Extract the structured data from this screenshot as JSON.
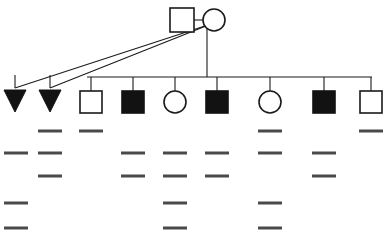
{
  "figure": {
    "type": "pedigree-with-gel",
    "background_color": "#ffffff",
    "line_color": "#1a1a1a",
    "filled_color": "#121212",
    "band_color": "#4a4a4a"
  },
  "chart_data": {
    "type": "table",
    "xlabel": "",
    "ylabel": "",
    "grid": false,
    "legend_position": "none",
    "generations": [
      {
        "id": "I",
        "label": "I",
        "y": 20,
        "members": [
          {
            "id": "I-1",
            "symbol": "square",
            "sex": "male",
            "affected": false,
            "x": 182,
            "y": 20,
            "size": 24
          },
          {
            "id": "I-2",
            "symbol": "circle",
            "sex": "female",
            "affected": false,
            "x": 214,
            "y": 20,
            "size": 22
          }
        ],
        "mating_line": {
          "x1": 194,
          "x2": 203,
          "y": 20
        }
      },
      {
        "id": "II",
        "label": "II",
        "y": 102,
        "sibship_line": {
          "x1": 87,
          "x2": 372,
          "y": 77
        },
        "descent_line": {
          "x": 207,
          "y1": 26,
          "y2": 77
        },
        "members": [
          {
            "id": "II-1",
            "symbol": "triangle",
            "sex": "unknown",
            "affected": true,
            "meaning": "pregnancy-loss",
            "x": 15,
            "y": 101,
            "size": 22,
            "lane": 1
          },
          {
            "id": "II-2",
            "symbol": "triangle",
            "sex": "unknown",
            "affected": true,
            "meaning": "pregnancy-loss",
            "x": 50,
            "y": 101,
            "size": 22,
            "lane": 2
          },
          {
            "id": "II-3",
            "symbol": "square",
            "sex": "male",
            "affected": false,
            "x": 91,
            "y": 102,
            "size": 22,
            "lane": 3
          },
          {
            "id": "II-4",
            "symbol": "square",
            "sex": "male",
            "affected": true,
            "x": 133,
            "y": 102,
            "size": 22,
            "lane": 4
          },
          {
            "id": "II-5",
            "symbol": "circle",
            "sex": "female",
            "affected": false,
            "x": 175,
            "y": 102,
            "size": 22,
            "lane": 5
          },
          {
            "id": "II-6",
            "symbol": "square",
            "sex": "male",
            "affected": true,
            "x": 217,
            "y": 102,
            "size": 22,
            "lane": 6
          },
          {
            "id": "II-7",
            "symbol": "circle",
            "sex": "female",
            "affected": false,
            "x": 270,
            "y": 102,
            "size": 22,
            "lane": 7
          },
          {
            "id": "II-8",
            "symbol": "square",
            "sex": "male",
            "affected": true,
            "x": 324,
            "y": 102,
            "size": 22,
            "lane": 8
          },
          {
            "id": "II-9",
            "symbol": "square",
            "sex": "male",
            "affected": false,
            "x": 371,
            "y": 102,
            "size": 22,
            "lane": 9
          }
        ]
      }
    ],
    "loss_connectors": [
      {
        "from": "I-2",
        "to": "II-1",
        "x1": 211,
        "y1": 24,
        "x2": 15,
        "y2": 88
      },
      {
        "from": "I-2",
        "to": "II-2",
        "x1": 211,
        "y1": 24,
        "x2": 50,
        "y2": 88
      }
    ],
    "gel": {
      "lane_count": 9,
      "row_count": 5,
      "row_y": [
        131,
        153,
        176,
        203,
        228
      ],
      "band_width": 24,
      "band_height": 3,
      "lane_x": [
        16,
        50,
        91,
        133,
        175,
        217,
        270,
        324,
        371
      ],
      "lanes": [
        {
          "lane": 1,
          "member": "II-1",
          "bands": [
            0,
            1,
            0,
            1,
            1
          ]
        },
        {
          "lane": 2,
          "member": "II-2",
          "bands": [
            1,
            1,
            1,
            0,
            0
          ]
        },
        {
          "lane": 3,
          "member": "II-3",
          "bands": [
            1,
            0,
            0,
            0,
            0
          ]
        },
        {
          "lane": 4,
          "member": "II-4",
          "bands": [
            0,
            1,
            1,
            0,
            0
          ]
        },
        {
          "lane": 5,
          "member": "II-5",
          "bands": [
            0,
            1,
            1,
            1,
            1
          ]
        },
        {
          "lane": 6,
          "member": "II-6",
          "bands": [
            0,
            1,
            1,
            0,
            0
          ]
        },
        {
          "lane": 7,
          "member": "II-7",
          "bands": [
            1,
            1,
            0,
            1,
            1
          ]
        },
        {
          "lane": 8,
          "member": "II-8",
          "bands": [
            0,
            1,
            1,
            0,
            0
          ]
        },
        {
          "lane": 9,
          "member": "II-9",
          "bands": [
            1,
            0,
            0,
            0,
            0
          ]
        }
      ]
    }
  }
}
